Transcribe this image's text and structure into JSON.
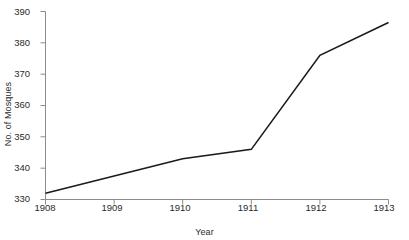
{
  "chart_data": {
    "type": "line",
    "title": "",
    "xlabel": "Year",
    "ylabel": "No. of Mosques",
    "x": [
      1908,
      1909,
      1910,
      1911,
      1912,
      1913
    ],
    "categories": [
      "1908",
      "1909",
      "1910",
      "1911",
      "1912",
      "1913"
    ],
    "values": [
      332,
      337.5,
      343,
      346,
      376,
      386.5
    ],
    "series": [
      {
        "name": "No. of Mosques",
        "values": [
          332,
          337.5,
          343,
          346,
          376,
          386.5
        ]
      }
    ],
    "xlim": [
      1908,
      1913
    ],
    "ylim": [
      330,
      390
    ],
    "yticks": [
      330,
      340,
      350,
      360,
      370,
      380,
      390
    ],
    "ytick_labels": [
      "330",
      "340",
      "350",
      "360",
      "370",
      "380",
      "390"
    ],
    "xticks": [
      1908,
      1909,
      1910,
      1911,
      1912,
      1913
    ],
    "xtick_labels": [
      "1908",
      "1909",
      "1910",
      "1911",
      "1912",
      "1913"
    ],
    "grid": false,
    "legend": false,
    "legend_position": "none",
    "line_color": "#1a1a1a",
    "axis_color": "#8c8c8c",
    "background_color": "#ffffff"
  }
}
